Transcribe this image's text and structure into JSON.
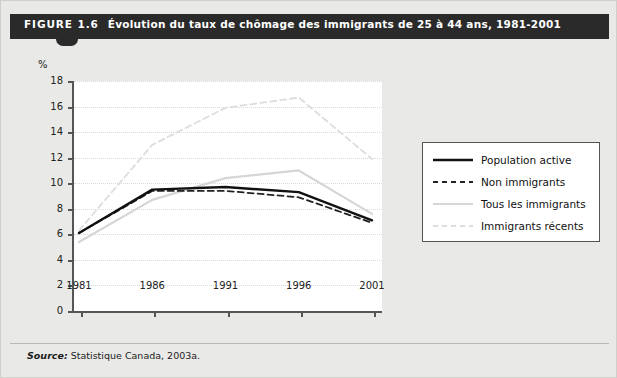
{
  "figure": {
    "label": "FIGURE 1.6",
    "title": "Évolution du taux de chômage des immigrants de 25 à 44 ans, 1981-2001",
    "source_prefix": "Source:",
    "source_text": "Statistique Canada, 2003a.",
    "banner_color": "#2a2a2a",
    "page_background": "#e9e9e7",
    "plot_background": "#ffffff"
  },
  "chart_data": {
    "type": "line",
    "title": "Évolution du taux de chômage des immigrants de 25 à 44 ans, 1981-2001",
    "xlabel": "",
    "ylabel": "%",
    "unit_label": "%",
    "categories": [
      1981,
      1986,
      1991,
      1996,
      2001
    ],
    "x": [
      "1981",
      "1986",
      "1991",
      "1996",
      "2001"
    ],
    "xtick_labels": [
      "1981",
      "1986",
      "1991",
      "1996",
      "2001"
    ],
    "ytick_labels": [
      "0",
      "2",
      "4",
      "6",
      "8",
      "10",
      "12",
      "14",
      "16",
      "18"
    ],
    "yticks": [
      0,
      2,
      4,
      6,
      8,
      10,
      12,
      14,
      16,
      18
    ],
    "ylim": [
      0,
      18
    ],
    "grid": true,
    "legend_position": "right",
    "series": [
      {
        "name": "Population active",
        "values": [
          6.1,
          9.5,
          9.7,
          9.3,
          7.1
        ],
        "color": "#111111",
        "style": "solid",
        "width": 2.4
      },
      {
        "name": "Non immigrants",
        "values": [
          6.1,
          9.4,
          9.4,
          8.9,
          6.9
        ],
        "color": "#222222",
        "style": "dashed",
        "width": 1.8
      },
      {
        "name": "Tous les immigrants",
        "values": [
          5.4,
          8.7,
          10.4,
          11.0,
          7.6
        ],
        "color": "#d6d6d6",
        "style": "solid",
        "width": 2.2
      },
      {
        "name": "Immigrants récents",
        "values": [
          6.3,
          13.0,
          15.9,
          16.7,
          11.9
        ],
        "color": "#dddddd",
        "style": "dashed",
        "width": 1.8
      }
    ]
  },
  "legend": {
    "entries": [
      {
        "label": "Population active"
      },
      {
        "label": "Non immigrants"
      },
      {
        "label": "Tous les immigrants"
      },
      {
        "label": "Immigrants récents"
      }
    ]
  }
}
